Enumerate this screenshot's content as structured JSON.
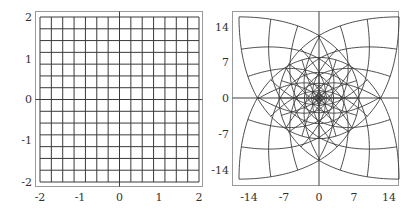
{
  "colors": {
    "grid_line": "#3a3a3a",
    "axis_line": "#2a2a2a",
    "frame": "#9a9a9a",
    "tick_text": "#333333",
    "background": "#ffffff"
  },
  "chart_data": [
    {
      "type": "line",
      "title": "",
      "description": "Square grid of horizontal and vertical lines over the domain [-2,2] x [-2,2]",
      "xlabel": "",
      "ylabel": "",
      "xlim": [
        -2,
        2
      ],
      "ylim": [
        -2,
        2
      ],
      "grid_lines_per_axis": 15,
      "grid_step": 0.2857,
      "xticks": [
        -2,
        -1,
        0,
        1,
        2
      ],
      "yticks": [
        -2,
        -1,
        0,
        1,
        2
      ],
      "xtick_labels": [
        "-2",
        "-1",
        "0",
        "1",
        "2"
      ],
      "ytick_labels": [
        "-2",
        "-1",
        "0",
        "1",
        "2"
      ],
      "axes_through_origin": true,
      "frame": true
    },
    {
      "type": "line",
      "title": "",
      "description": "Image of the square grid under the complex map w = z^3 (four overlapping petals, dense near the origin)",
      "map": "z^3",
      "xlabel": "",
      "ylabel": "",
      "xlim": [
        -17,
        16
      ],
      "ylim": [
        -17,
        17
      ],
      "xticks": [
        -14,
        -7,
        0,
        7,
        14
      ],
      "yticks": [
        -14,
        -7,
        0,
        7,
        14
      ],
      "xtick_labels": [
        "-14",
        "-7",
        "0",
        "7",
        "14"
      ],
      "ytick_labels": [
        "-14",
        "-7",
        "0",
        "7",
        "14"
      ],
      "axes_through_origin": true,
      "frame": true
    }
  ],
  "left_plot": {
    "xtick_labels": [
      "-2",
      "-1",
      "0",
      "1",
      "2"
    ],
    "ytick_labels": [
      "2",
      "1",
      "0",
      "-1",
      "-2"
    ]
  },
  "right_plot": {
    "xtick_labels": [
      "-14",
      "-7",
      "0",
      "7",
      "14"
    ],
    "ytick_labels": [
      "14",
      "7",
      "0",
      "-7",
      "-14"
    ]
  }
}
